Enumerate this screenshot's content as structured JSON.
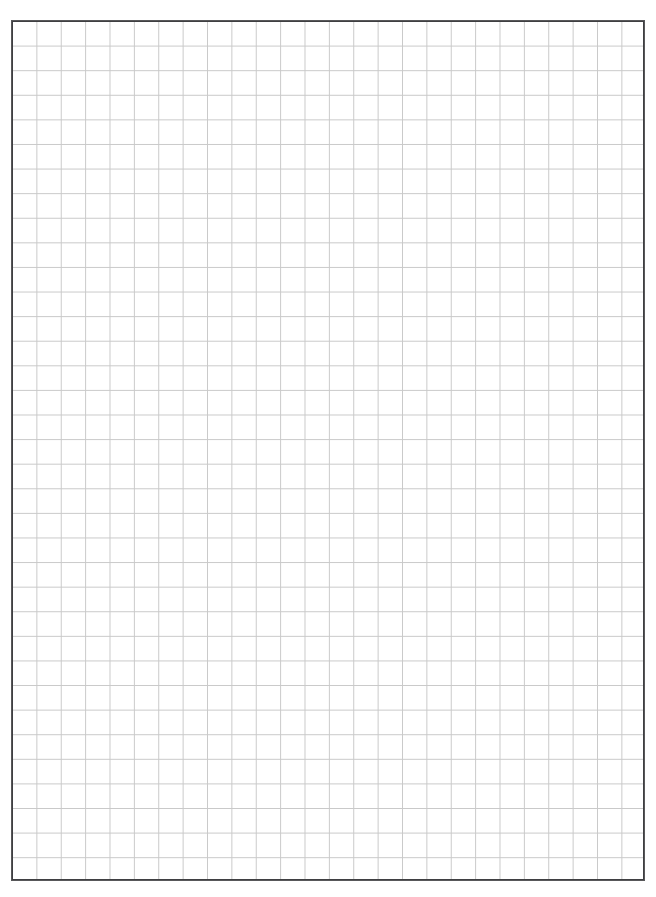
{
  "page": {
    "kind": "graph-paper-sheet",
    "background_color": "#ffffff",
    "width_px": 656,
    "height_px": 897
  },
  "clipped_header": {
    "note": "text line clipped by the top edge of the page; only descenders visible",
    "text": "",
    "color": "#c9c9cf"
  },
  "grid": {
    "columns": 26,
    "rows": 35,
    "cell_width_px": 24.385,
    "cell_height_px": 24.6,
    "left_px": 11,
    "top_px": 20,
    "width_px": 634,
    "height_px": 861,
    "line_color": "#c9c9c9",
    "line_width_px": 1,
    "border_color": "#58585a",
    "border_width_px": 1.5,
    "fill_color": "#ffffff"
  },
  "chart_data": {
    "type": "table",
    "title": "",
    "xlabel": "",
    "ylabel": "",
    "grid": true,
    "legend": "none",
    "columns": 26,
    "rows": 35,
    "values": [],
    "annotations": []
  }
}
